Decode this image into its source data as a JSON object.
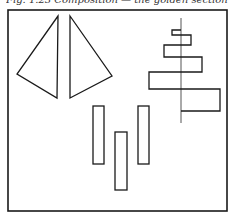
{
  "caption": {
    "text": "Fig. 1.23 Composition — the golden section"
  },
  "figure": {
    "frame": {
      "x": 8,
      "y": 10,
      "w": 219,
      "h": 201
    },
    "stroke_color": "#1a1a1a",
    "background": "#ffffff",
    "triangles": [
      {
        "name": "left-triangle",
        "points": "58,16 17,74 57,98"
      },
      {
        "name": "right-triangle",
        "points": "70,16 112,76 70,98"
      }
    ],
    "spiral": {
      "axis": {
        "x1": 181,
        "y1": 18,
        "x2": 181,
        "y2": 123
      },
      "path": "M181,30 L172,30 L172,34 L191,36 L191,46 L181,46 M181,34 L181,36 M164,45 L181,45 M164,45 L164,57 L202,57 L202,72 L149,72 L149,89 L220,89 L220,111 L181,111 M181,36 L191,36 M172,34 L181,34"
    },
    "bars": [
      {
        "name": "left-bar",
        "x": 93,
        "y": 106,
        "w": 11,
        "h": 58
      },
      {
        "name": "middle-bar",
        "x": 115,
        "y": 132,
        "w": 12,
        "h": 58
      },
      {
        "name": "right-bar",
        "x": 138,
        "y": 106,
        "w": 11,
        "h": 58
      }
    ]
  }
}
